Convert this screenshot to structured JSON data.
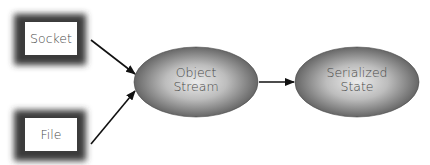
{
  "diagram": {
    "nodes": [
      {
        "id": "socket",
        "shape": "shadowed-rectangle",
        "label": "Socket"
      },
      {
        "id": "file",
        "shape": "shadowed-rectangle",
        "label": "File"
      },
      {
        "id": "object-stream",
        "shape": "ellipse",
        "label_lines": [
          "Object",
          "Stream"
        ]
      },
      {
        "id": "serialized-state",
        "shape": "ellipse",
        "label_lines": [
          "Serialized",
          "State"
        ]
      }
    ],
    "edges": [
      {
        "from": "socket",
        "to": "object-stream"
      },
      {
        "from": "file",
        "to": "object-stream"
      },
      {
        "from": "object-stream",
        "to": "serialized-state"
      }
    ]
  },
  "colors": {
    "box_shadow_dark": "#3a3a3a",
    "box_fill": "#ffffff",
    "ellipse_center": "#e6e6e6",
    "ellipse_edge": "#5a5a5a",
    "arrow": "#111111",
    "text": "#4a4a4a"
  }
}
